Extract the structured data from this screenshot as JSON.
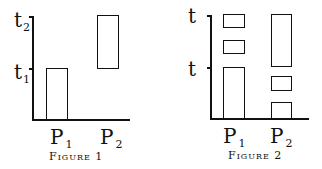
{
  "figures": [
    {
      "caption": "Figure 1",
      "y_labels": [
        {
          "text": "t",
          "sub": "2"
        },
        {
          "text": "t",
          "sub": "1"
        }
      ],
      "x_labels": [
        {
          "text": "P",
          "sub": "1"
        },
        {
          "text": "P",
          "sub": "2"
        }
      ],
      "blocks": {
        "p1": [
          {
            "from": 0,
            "to": "t1"
          }
        ],
        "p2": [
          {
            "from": "t1",
            "to": "t2"
          }
        ]
      }
    },
    {
      "caption": "Figure 2",
      "y_labels": [
        {
          "text": "t",
          "sub": ""
        },
        {
          "text": "t",
          "sub": ""
        }
      ],
      "x_labels": [
        {
          "text": "P",
          "sub": "1"
        },
        {
          "text": "P",
          "sub": "2"
        }
      ],
      "blocks": {
        "p1": [
          {
            "from": 0,
            "to": "t lower"
          },
          {
            "segment": "middle small"
          },
          {
            "segment": "top small"
          }
        ],
        "p2": [
          {
            "segment": "bottom small"
          },
          {
            "segment": "lower-middle small"
          },
          {
            "from": "t lower",
            "to": "t upper"
          }
        ]
      }
    }
  ]
}
